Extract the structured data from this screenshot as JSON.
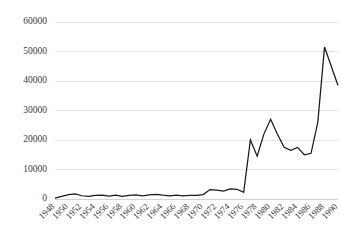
{
  "chart_data": {
    "type": "line",
    "title": "",
    "subtitle": "",
    "xlabel": "",
    "ylabel": "",
    "grid": true,
    "legend": false,
    "legend_position": "none",
    "line_color": "#1a1a1a",
    "gridline_color": "#e3e3e3",
    "tick_label_color": "#3a3a3a",
    "background_color": "#ffffff",
    "ylim": [
      0,
      60000
    ],
    "ytick_values": [
      0,
      10000,
      20000,
      30000,
      40000,
      50000,
      60000
    ],
    "ytick_labels": [
      "0",
      "10000",
      "20000",
      "30000",
      "40000",
      "50000",
      "60000"
    ],
    "xlim": [
      1948,
      1990
    ],
    "xtick_values": [
      1948,
      1950,
      1952,
      1954,
      1956,
      1958,
      1960,
      1962,
      1964,
      1966,
      1968,
      1970,
      1972,
      1974,
      1976,
      1978,
      1980,
      1982,
      1984,
      1986,
      1988,
      1990
    ],
    "xtick_labels": [
      "1948",
      "1950",
      "1952",
      "1954",
      "1956",
      "1958",
      "1960",
      "1962",
      "1964",
      "1966",
      "1968",
      "1970",
      "1972",
      "1974",
      "1976",
      "1978",
      "1980",
      "1982",
      "1984",
      "1986",
      "1988",
      "1990"
    ],
    "xtick_label_rotation": -45,
    "x": [
      1948,
      1949,
      1950,
      1951,
      1952,
      1953,
      1954,
      1955,
      1956,
      1957,
      1958,
      1959,
      1960,
      1961,
      1962,
      1963,
      1964,
      1965,
      1966,
      1967,
      1968,
      1969,
      1970,
      1971,
      1972,
      1973,
      1974,
      1975,
      1976,
      1977,
      1978,
      1979,
      1980,
      1981,
      1982,
      1983,
      1984,
      1985,
      1986,
      1987,
      1988,
      1989,
      1990
    ],
    "values": [
      300,
      900,
      1500,
      1700,
      1100,
      900,
      1200,
      1300,
      1000,
      1300,
      900,
      1200,
      1400,
      1100,
      1400,
      1600,
      1300,
      1100,
      1300,
      1100,
      1200,
      1200,
      1500,
      3200,
      3000,
      2700,
      3400,
      3300,
      2300,
      20000,
      14500,
      22000,
      27000,
      22000,
      17500,
      16500,
      17500,
      15000,
      15500,
      26000,
      51500,
      45000,
      38500
    ]
  }
}
